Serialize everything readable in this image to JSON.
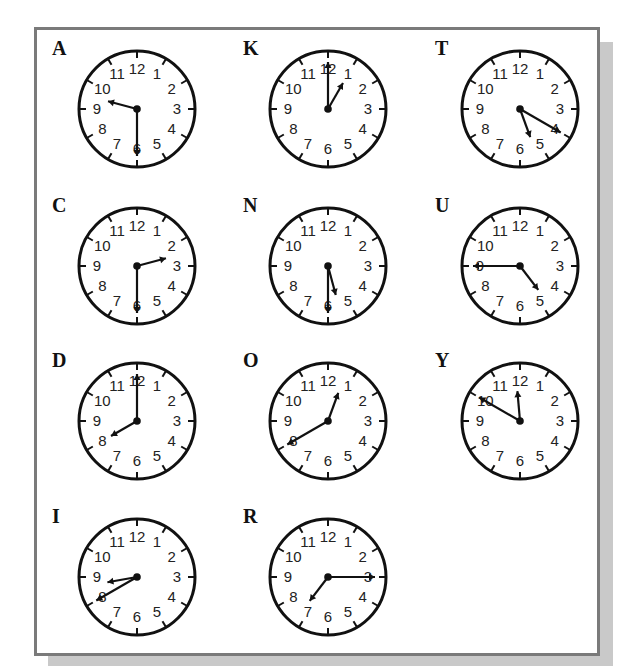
{
  "worksheet": {
    "clocks": [
      {
        "letter": "A",
        "time": "9:30",
        "hour": 9,
        "minute": 30,
        "cx": 137,
        "cy": 109
      },
      {
        "letter": "K",
        "time": "1:00",
        "hour": 1,
        "minute": 0,
        "cx": 328,
        "cy": 109
      },
      {
        "letter": "T",
        "time": "5:20",
        "hour": 5,
        "minute": 20,
        "cx": 520,
        "cy": 109
      },
      {
        "letter": "C",
        "time": "2:30",
        "hour": 2,
        "minute": 30,
        "cx": 137,
        "cy": 266
      },
      {
        "letter": "N",
        "time": "5:30",
        "hour": 5,
        "minute": 30,
        "cx": 328,
        "cy": 266
      },
      {
        "letter": "U",
        "time": "4:45",
        "hour": 4,
        "minute": 45,
        "cx": 520,
        "cy": 266
      },
      {
        "letter": "D",
        "time": "8:00",
        "hour": 8,
        "minute": 0,
        "cx": 137,
        "cy": 421
      },
      {
        "letter": "O",
        "time": "12:40",
        "hour": 12,
        "minute": 40,
        "cx": 328,
        "cy": 421
      },
      {
        "letter": "Y",
        "time": "11:50",
        "hour": 11,
        "minute": 50,
        "cx": 520,
        "cy": 421
      },
      {
        "letter": "I",
        "time": "8:40",
        "hour": 8,
        "minute": 40,
        "cx": 137,
        "cy": 577
      },
      {
        "letter": "R",
        "time": "7:15",
        "hour": 7,
        "minute": 15,
        "cx": 328,
        "cy": 577
      }
    ],
    "dial_numbers": [
      "12",
      "1",
      "2",
      "3",
      "4",
      "5",
      "6",
      "7",
      "8",
      "9",
      "10",
      "11"
    ],
    "colors": {
      "ink": "#111111",
      "border": "#7a7a7a",
      "shadow": "#c9c9c9",
      "background": "#ffffff"
    }
  }
}
